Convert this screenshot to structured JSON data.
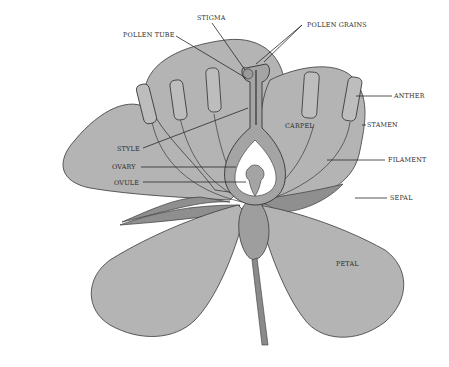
{
  "diagram": {
    "labels": {
      "stigma": "STIGMA",
      "pollen_grains": "POLLEN GRAINS",
      "pollen_tube": "POLLEN TUBE",
      "anther": "ANTHER",
      "stamen": "STAMEN",
      "carpel": "CARPEL",
      "style": "STYLE",
      "ovary": "OVARY",
      "ovule": "OVULE",
      "filament": "FILAMENT",
      "sepal": "SEPAL",
      "petal": "PETAL"
    },
    "colors": {
      "petal": "#b4b4b4",
      "sepal": "#8f8f8f",
      "outline": "#3a3a3a",
      "background": "#ffffff"
    }
  }
}
